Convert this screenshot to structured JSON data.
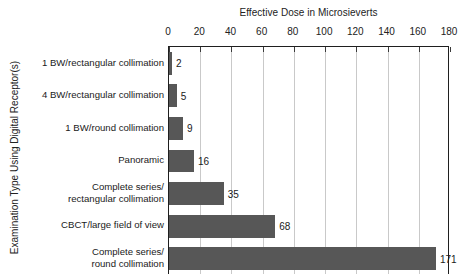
{
  "chart_data": {
    "type": "bar",
    "orientation": "horizontal",
    "title": "",
    "xlabel": "Effective Dose in Microsieverts",
    "ylabel": "Examination Type Using Digital Receptor(s)",
    "xlim": [
      0,
      180
    ],
    "xticks": [
      0,
      20,
      40,
      60,
      80,
      100,
      120,
      140,
      160,
      180
    ],
    "grid": true,
    "legend": false,
    "categories": [
      "1 BW/rectangular collimation",
      "4 BW/rectangular collimation",
      "1 BW/round collimation",
      "Panoramic",
      "Complete series/\nrectangular collimation",
      "CBCT/large field of view",
      "Complete series/\nround collimation"
    ],
    "values": [
      2,
      5,
      9,
      16,
      35,
      68,
      171
    ],
    "data_labels": [
      "2",
      "5",
      "9",
      "16",
      "35",
      "68",
      "171"
    ],
    "colors": {
      "bar": "#575757",
      "grid": "#c9c9c9",
      "axis": "#1f1f1f",
      "text": "#1a1a1a",
      "background": "#ffffff"
    }
  },
  "axis": {
    "x_title": "Effective Dose in Microsieverts",
    "y_title": "Examination Type Using Digital Receptor(s)",
    "tick_labels": [
      "0",
      "20",
      "40",
      "60",
      "80",
      "100",
      "120",
      "140",
      "160",
      "180"
    ]
  }
}
